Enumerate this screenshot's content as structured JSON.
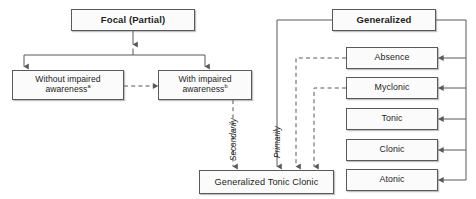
{
  "diagram": {
    "title_focal": "Focal (Partial)",
    "title_generalized": "Generalized",
    "focal_branch": {
      "without_label": "Without impaired awareness",
      "without_marker": "a",
      "with_label": "With impaired awareness",
      "with_marker": "b"
    },
    "outcome": {
      "label": "Generalized Tonic Clonic"
    },
    "generalized_subtypes": [
      {
        "label": "Absence"
      },
      {
        "label": "Myclonic"
      },
      {
        "label": "Tonic"
      },
      {
        "label": "Clonic"
      },
      {
        "label": "Atonic"
      }
    ],
    "edge_labels": {
      "secondarily": "Secondarily",
      "primarily": "Primarily"
    },
    "colors": {
      "stroke": "#58595b",
      "text": "#231f20",
      "fill": "#fbfbfb",
      "background": "#ffffff"
    }
  }
}
